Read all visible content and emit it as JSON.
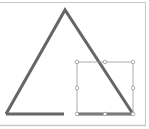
{
  "canvas": {
    "background": "#ffffff",
    "frame_color": "#c8c8c8"
  },
  "shape": {
    "type": "triangle",
    "stroke_color": "#666666",
    "stroke_width": 3,
    "apex": [
      65,
      10
    ],
    "bottom_left": [
      6,
      114
    ],
    "bottom_right": [
      133,
      114
    ],
    "base_gap": [
      64,
      77
    ]
  },
  "selection": {
    "stroke_color": "#999999",
    "handle_fill": "#ffffff",
    "handle_stroke": "#999999",
    "x": 77,
    "y": 62,
    "width": 56,
    "height": 52,
    "handles": [
      "top-left",
      "top-mid",
      "top-right",
      "mid-left",
      "mid-right",
      "bottom-left",
      "bottom-mid",
      "bottom-right"
    ]
  }
}
